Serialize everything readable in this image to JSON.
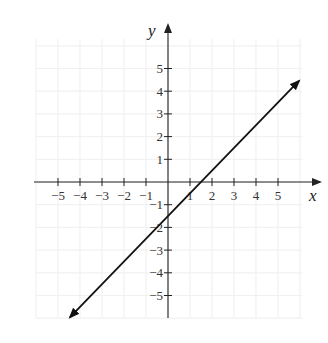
{
  "chart_data": {
    "type": "line",
    "title": "",
    "xlabel": "x",
    "ylabel": "y",
    "xlim": [
      -6,
      6.5
    ],
    "ylim": [
      -6,
      6.5
    ],
    "x_ticks": [
      -5,
      -4,
      -3,
      -2,
      -1,
      1,
      2,
      3,
      4,
      5
    ],
    "y_ticks": [
      5,
      4,
      3,
      2,
      1,
      -1,
      -2,
      -3,
      -4,
      -5
    ],
    "x_tick_labels": [
      "−5",
      "−4",
      "−3",
      "−2",
      "−1",
      "1",
      "2",
      "3",
      "4",
      "5"
    ],
    "y_tick_labels": [
      "5",
      "4",
      "3",
      "2",
      "1",
      "−1",
      "−2",
      "−3",
      "−4",
      "−5"
    ],
    "grid": true,
    "legend": null,
    "series": [
      {
        "name": "line",
        "equation": "y = x - 1.5",
        "slope": 1,
        "intercept": -1.5,
        "x": [
          -4.45,
          5.95
        ],
        "y": [
          -5.95,
          4.45
        ],
        "arrows": "both",
        "color": "#111111"
      }
    ],
    "intercepts": {
      "x_intercept": 1.5,
      "y_intercept": -1.5
    }
  },
  "colors": {
    "axis": "#222222",
    "line": "#111111",
    "grid": "#f1f1f1",
    "background": "#ffffff"
  }
}
